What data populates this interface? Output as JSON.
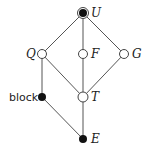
{
  "diagram": {
    "type": "lattice",
    "nodes": [
      {
        "id": "U",
        "label": "U",
        "x": 83,
        "y": 13,
        "style": "filled-ringed",
        "label_side": "right"
      },
      {
        "id": "Q",
        "label": "Q",
        "x": 42,
        "y": 54,
        "style": "open",
        "label_side": "left"
      },
      {
        "id": "F",
        "label": "F",
        "x": 83,
        "y": 54,
        "style": "open",
        "label_side": "right"
      },
      {
        "id": "G",
        "label": "G",
        "x": 124,
        "y": 54,
        "style": "open",
        "label_side": "right"
      },
      {
        "id": "block",
        "label": "block",
        "x": 42,
        "y": 97,
        "style": "filled",
        "label_side": "left"
      },
      {
        "id": "T",
        "label": "T",
        "x": 83,
        "y": 97,
        "style": "open",
        "label_side": "right"
      },
      {
        "id": "E",
        "label": "E",
        "x": 83,
        "y": 139,
        "style": "filled",
        "label_side": "right"
      }
    ],
    "edges": [
      [
        "U",
        "Q"
      ],
      [
        "U",
        "F"
      ],
      [
        "U",
        "G"
      ],
      [
        "Q",
        "block"
      ],
      [
        "Q",
        "T"
      ],
      [
        "F",
        "T"
      ],
      [
        "G",
        "T"
      ],
      [
        "block",
        "E"
      ],
      [
        "T",
        "E"
      ]
    ],
    "colors": {
      "line": "#555555",
      "fill": "#111111",
      "open": "#ffffff"
    }
  }
}
